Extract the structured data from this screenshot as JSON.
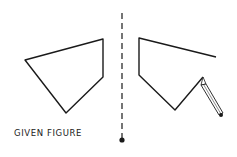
{
  "caption": "GIVEN FIGURE",
  "colors": {
    "stroke": "#1a1a1a",
    "background": "#ffffff"
  },
  "given_figure": {
    "vertices": [
      [
        25,
        60
      ],
      [
        103,
        39
      ],
      [
        103,
        77
      ],
      [
        66,
        113
      ]
    ],
    "closed": true
  },
  "mirror_line": {
    "x": 122,
    "y_top": 13,
    "y_bottom": 140,
    "style": "dashed",
    "end_marker": "dot"
  },
  "reflected_figure": {
    "vertices": [
      [
        216,
        57
      ],
      [
        139,
        38
      ],
      [
        139,
        75
      ],
      [
        175,
        110
      ],
      [
        203,
        77
      ]
    ],
    "closed": false,
    "status": "in progress"
  },
  "pencil": {
    "tip": [
      203,
      77
    ],
    "end": [
      222,
      116
    ]
  }
}
